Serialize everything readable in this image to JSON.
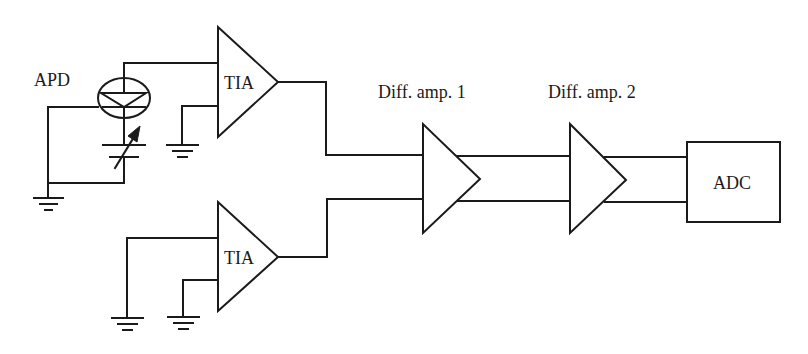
{
  "diagram": {
    "type": "circuit-block-diagram",
    "labels": {
      "apd": "APD",
      "tia_top": "TIA",
      "tia_bottom": "TIA",
      "diff_amp_1": "Diff. amp. 1",
      "diff_amp_2": "Diff. amp. 2",
      "adc": "ADC"
    },
    "colors": {
      "line": "#1a1a1a",
      "background": "#ffffff"
    }
  }
}
